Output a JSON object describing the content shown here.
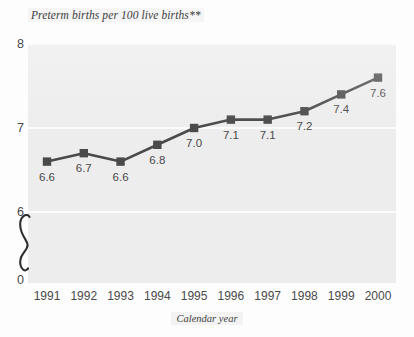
{
  "chart_data": {
    "type": "line",
    "title": "Preterm births per 100 live births**",
    "xlabel": "Calendar year",
    "ylabel": "",
    "categories": [
      "1991",
      "1992",
      "1993",
      "1994",
      "1995",
      "1996",
      "1997",
      "1998",
      "1999",
      "2000"
    ],
    "values": [
      6.6,
      6.7,
      6.6,
      6.8,
      7.0,
      7.1,
      7.1,
      7.2,
      7.4,
      7.6
    ],
    "point_labels": [
      "6.6",
      "6.7",
      "6.6",
      "6.8",
      "7.0",
      "7.1",
      "7.1",
      "7.2",
      "7.4",
      "7.6"
    ],
    "y_ticks": [
      "0",
      "6",
      "7",
      "8"
    ],
    "y_tick_values": [
      0,
      6,
      7,
      8
    ],
    "ylim": [
      6,
      8
    ],
    "y_axis_break": true,
    "y_axis_break_between": [
      0,
      6
    ],
    "grid": true,
    "gridlines_at": [
      6,
      7,
      8
    ],
    "legend": null,
    "marker": "square",
    "colors": {
      "series": "#4a4a4a",
      "marker": "#4a4a4a",
      "plot_background": "#ededed",
      "gridline": "#fbfbfb",
      "text": "#4a4a4a",
      "page_background": "#fdfdfd"
    }
  },
  "footnote_marker": "**"
}
